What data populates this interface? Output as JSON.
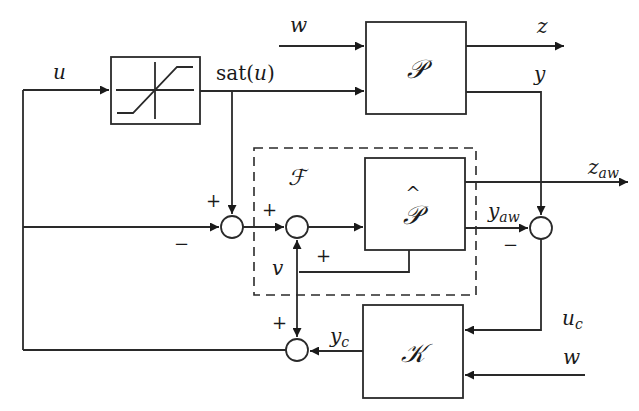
{
  "diagram": {
    "type": "anti-windup control block diagram",
    "colors": {
      "stroke": "#2a2a2a",
      "background": "#ffffff",
      "text": "#1a1a1a"
    },
    "blocks": {
      "saturation": {
        "label": "saturation-nonlinearity"
      },
      "plant": {
        "label": "𝒫"
      },
      "plant_hat": {
        "label": "𝒫̂"
      },
      "controller": {
        "label": "𝒦"
      },
      "filter_region": {
        "label": "ℱ"
      }
    },
    "signals": {
      "u": "u",
      "sat_u": "sat(u)",
      "w_top": "w",
      "z": "z",
      "y": "y",
      "z_aw_main": "z",
      "z_aw_sub": "aw",
      "y_aw_main": "y",
      "y_aw_sub": "aw",
      "v": "v",
      "u_c_main": "u",
      "u_c_sub": "c",
      "y_c_main": "y",
      "y_c_sub": "c",
      "w_bottom": "w"
    },
    "signs": {
      "sum1_top": "+",
      "sum1_left": "−",
      "sum2_left": "+",
      "sum2_bottom": "+",
      "sum3_left": "−",
      "sum4_top": "+"
    }
  }
}
